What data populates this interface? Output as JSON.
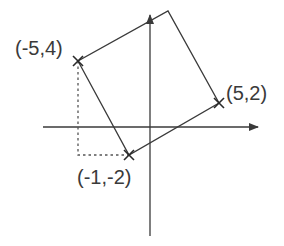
{
  "diagram": {
    "type": "coordinate-geometry",
    "colors": {
      "line": "#3a3a3a",
      "dashed": "#555555",
      "text": "#3a3a3a",
      "background": "#ffffff"
    },
    "axes": {
      "x_axis": {
        "from": [
          43,
          127
        ],
        "to": [
          258,
          127
        ],
        "arrow": true
      },
      "y_axis": {
        "from": [
          150,
          236
        ],
        "to": [
          150,
          14
        ],
        "arrow": true
      }
    },
    "points": [
      {
        "id": "A",
        "label": "(-5,4)",
        "px": [
          78,
          61
        ],
        "marker": "x"
      },
      {
        "id": "B",
        "label": "(-1,-2)",
        "px": [
          129,
          155
        ],
        "marker": "x"
      },
      {
        "id": "C",
        "label": "(5,2)",
        "px": [
          219,
          103
        ],
        "marker": "x"
      },
      {
        "id": "D",
        "label": "",
        "px": [
          168,
          11
        ],
        "marker": "none"
      }
    ],
    "labels": {
      "a": "(-5,4)",
      "b": "(-1,-2)",
      "c": "(5,2)"
    },
    "dashed_guides": [
      {
        "from": [
          78,
          61
        ],
        "to": [
          78,
          155
        ]
      },
      {
        "from": [
          78,
          155
        ],
        "to": [
          129,
          155
        ]
      }
    ]
  }
}
